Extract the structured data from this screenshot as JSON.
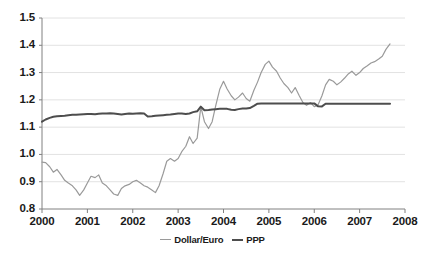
{
  "chart_data": {
    "type": "line",
    "title": "",
    "subtitle": "",
    "xlabel": "",
    "ylabel": "",
    "xlim": [
      2000.0,
      2008.0
    ],
    "ylim": [
      0.8,
      1.5
    ],
    "grid": true,
    "grid_axis": "y",
    "legend_position": "bottom-center",
    "x_tick_labels": [
      "2000",
      "2001",
      "2002",
      "2003",
      "2004",
      "2005",
      "2006",
      "2007",
      "2008"
    ],
    "x_ticks": [
      2000,
      2001,
      2002,
      2003,
      2004,
      2005,
      2006,
      2007,
      2008
    ],
    "y_tick_labels": [
      "0.8",
      "0.9",
      "1.0",
      "1.1",
      "1.2",
      "1.3",
      "1.4",
      "1.5"
    ],
    "y_ticks": [
      0.8,
      0.9,
      1.0,
      1.1,
      1.2,
      1.3,
      1.4,
      1.5
    ],
    "colors": {
      "dollar_euro": "#9a9a9a",
      "ppp": "#4d4d4d",
      "grid": "#e2e2e2",
      "axis": "#808080",
      "text": "#1a1a1a"
    },
    "series": [
      {
        "name": "Dollar/Euro",
        "color": "#9a9a9a",
        "x": [
          2000.0,
          2000.08,
          2000.17,
          2000.25,
          2000.33,
          2000.42,
          2000.5,
          2000.58,
          2000.67,
          2000.75,
          2000.83,
          2000.92,
          2001.0,
          2001.08,
          2001.17,
          2001.25,
          2001.33,
          2001.42,
          2001.5,
          2001.58,
          2001.67,
          2001.75,
          2001.83,
          2001.92,
          2002.0,
          2002.08,
          2002.17,
          2002.25,
          2002.33,
          2002.42,
          2002.5,
          2002.58,
          2002.67,
          2002.75,
          2002.83,
          2002.92,
          2003.0,
          2003.08,
          2003.17,
          2003.25,
          2003.33,
          2003.42,
          2003.5,
          2003.58,
          2003.67,
          2003.75,
          2003.83,
          2003.92,
          2004.0,
          2004.08,
          2004.17,
          2004.25,
          2004.33,
          2004.42,
          2004.5,
          2004.58,
          2004.67,
          2004.75,
          2004.83,
          2004.92,
          2005.0,
          2005.08,
          2005.17,
          2005.25,
          2005.33,
          2005.42,
          2005.5,
          2005.58,
          2005.67,
          2005.75,
          2005.83,
          2005.92,
          2006.0,
          2006.08,
          2006.17,
          2006.25,
          2006.33,
          2006.42,
          2006.5,
          2006.58,
          2006.67,
          2006.75,
          2006.83,
          2006.92,
          2007.0,
          2007.08,
          2007.17,
          2007.25,
          2007.33,
          2007.42,
          2007.5,
          2007.58,
          2007.67
        ],
        "y": [
          0.972,
          0.97,
          0.955,
          0.935,
          0.945,
          0.925,
          0.905,
          0.895,
          0.885,
          0.87,
          0.85,
          0.87,
          0.895,
          0.92,
          0.915,
          0.925,
          0.895,
          0.885,
          0.87,
          0.855,
          0.85,
          0.875,
          0.885,
          0.89,
          0.9,
          0.905,
          0.895,
          0.885,
          0.88,
          0.87,
          0.86,
          0.885,
          0.93,
          0.975,
          0.985,
          0.975,
          0.985,
          1.01,
          1.03,
          1.065,
          1.04,
          1.06,
          1.175,
          1.12,
          1.095,
          1.12,
          1.18,
          1.24,
          1.268,
          1.24,
          1.215,
          1.2,
          1.21,
          1.225,
          1.205,
          1.195,
          1.235,
          1.265,
          1.3,
          1.33,
          1.342,
          1.32,
          1.305,
          1.28,
          1.26,
          1.245,
          1.225,
          1.245,
          1.215,
          1.19,
          1.18,
          1.19,
          1.175,
          1.18,
          1.215,
          1.255,
          1.275,
          1.268,
          1.255,
          1.265,
          1.28,
          1.295,
          1.305,
          1.29,
          1.3,
          1.315,
          1.325,
          1.335,
          1.34,
          1.35,
          1.36,
          1.385,
          1.405
        ]
      },
      {
        "name": "PPP",
        "color": "#4d4d4d",
        "x": [
          2000.0,
          2000.08,
          2000.17,
          2000.25,
          2000.33,
          2000.42,
          2000.5,
          2000.58,
          2000.67,
          2000.75,
          2000.83,
          2000.92,
          2001.0,
          2001.08,
          2001.17,
          2001.25,
          2001.33,
          2001.42,
          2001.5,
          2001.58,
          2001.67,
          2001.75,
          2001.83,
          2001.92,
          2002.0,
          2002.08,
          2002.17,
          2002.25,
          2002.33,
          2002.42,
          2002.5,
          2002.58,
          2002.67,
          2002.75,
          2002.83,
          2002.92,
          2003.0,
          2003.08,
          2003.17,
          2003.25,
          2003.33,
          2003.42,
          2003.5,
          2003.58,
          2003.67,
          2003.75,
          2003.83,
          2003.92,
          2004.0,
          2004.08,
          2004.17,
          2004.25,
          2004.33,
          2004.42,
          2004.5,
          2004.58,
          2004.67,
          2004.75,
          2004.83,
          2004.92,
          2005.0,
          2005.25,
          2005.5,
          2005.75,
          2006.0,
          2006.08,
          2006.17,
          2006.25,
          2006.5,
          2006.75,
          2007.0,
          2007.25,
          2007.5,
          2007.67
        ],
        "y": [
          1.12,
          1.128,
          1.134,
          1.138,
          1.14,
          1.141,
          1.142,
          1.144,
          1.145,
          1.145,
          1.146,
          1.147,
          1.148,
          1.148,
          1.147,
          1.149,
          1.15,
          1.15,
          1.151,
          1.15,
          1.148,
          1.146,
          1.148,
          1.15,
          1.149,
          1.15,
          1.151,
          1.15,
          1.139,
          1.14,
          1.142,
          1.143,
          1.144,
          1.145,
          1.146,
          1.148,
          1.15,
          1.15,
          1.148,
          1.15,
          1.155,
          1.158,
          1.175,
          1.162,
          1.163,
          1.165,
          1.166,
          1.167,
          1.167,
          1.167,
          1.164,
          1.163,
          1.166,
          1.168,
          1.168,
          1.17,
          1.178,
          1.186,
          1.187,
          1.187,
          1.187,
          1.187,
          1.187,
          1.187,
          1.187,
          1.177,
          1.176,
          1.186,
          1.186,
          1.186,
          1.186,
          1.186,
          1.186,
          1.186
        ]
      }
    ]
  },
  "legend": {
    "items": [
      {
        "label": "Dollar/Euro"
      },
      {
        "label": "PPP"
      }
    ]
  }
}
